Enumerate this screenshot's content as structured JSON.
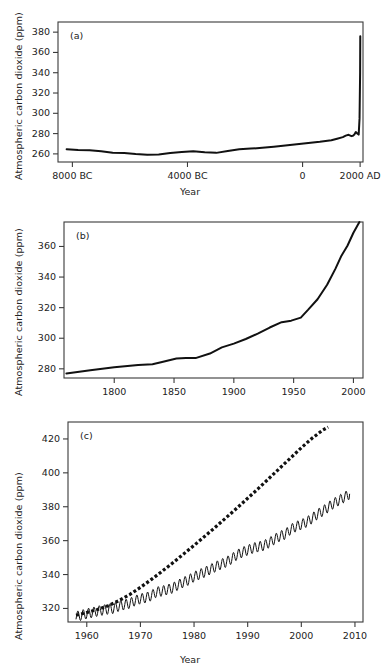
{
  "figure": {
    "ylabel": "Atmospheric carbon dioxide (ppm)",
    "xlabel": "Year"
  },
  "chart_data": [
    {
      "type": "line",
      "panel": "(a)",
      "title": "",
      "xlabel": "Year",
      "ylabel": "Atmospheric carbon dioxide (ppm)",
      "xlim": [
        -8500,
        2100
      ],
      "ylim": [
        252,
        390
      ],
      "xticks": [
        -8000,
        -4000,
        0,
        2000
      ],
      "xticklabels": [
        "8000 BC",
        "4000 BC",
        "0",
        "2000 AD"
      ],
      "yticks": [
        260,
        280,
        300,
        320,
        340,
        360,
        380
      ],
      "yticklabels": [
        "260",
        "280",
        "300",
        "320",
        "340",
        "360",
        "380"
      ],
      "grid": false,
      "legend": "none",
      "series": [
        {
          "name": "Ice-core and modern CO2",
          "style": "solid",
          "x": [
            -8200,
            -7800,
            -7400,
            -7000,
            -6600,
            -6200,
            -5800,
            -5400,
            -5000,
            -4600,
            -4200,
            -3800,
            -3400,
            -3000,
            -2600,
            -2200,
            -1800,
            -1400,
            -1000,
            -600,
            -200,
            200,
            600,
            1000,
            1200,
            1400,
            1500,
            1600,
            1700,
            1750,
            1800,
            1850,
            1900,
            1950,
            1980,
            2000,
            2005
          ],
          "y": [
            264.5,
            263.8,
            263.5,
            262.5,
            261.2,
            260.8,
            259.8,
            259.2,
            259.5,
            260.8,
            261.8,
            262.5,
            261.5,
            261.0,
            262.8,
            264.5,
            265.2,
            266.0,
            267.0,
            268.2,
            269.5,
            270.8,
            272.0,
            273.5,
            275.0,
            276.5,
            278.0,
            278.8,
            277.5,
            277.8,
            279.0,
            281.5,
            280.2,
            279.0,
            295.0,
            340.0,
            376.0
          ]
        }
      ]
    },
    {
      "type": "line",
      "panel": "(b)",
      "title": "",
      "xlabel": "",
      "ylabel": "Atmospheric carbon dioxide (ppm)",
      "xlim": [
        1758,
        2008
      ],
      "ylim": [
        274,
        376
      ],
      "xticks": [
        1800,
        1850,
        1900,
        1950,
        2000
      ],
      "xticklabels": [
        "1800",
        "1850",
        "1900",
        "1950",
        "2000"
      ],
      "yticks": [
        280,
        300,
        320,
        340,
        360
      ],
      "yticklabels": [
        "280",
        "300",
        "320",
        "340",
        "360"
      ],
      "grid": false,
      "legend": "none",
      "series": [
        {
          "name": "CO2 since 1760",
          "style": "solid",
          "x": [
            1760,
            1780,
            1800,
            1820,
            1832,
            1840,
            1852,
            1860,
            1868,
            1880,
            1890,
            1900,
            1910,
            1920,
            1930,
            1940,
            1948,
            1956,
            1962,
            1970,
            1978,
            1985,
            1990,
            1995,
            2000,
            2005
          ],
          "y": [
            277.0,
            279.0,
            281.0,
            282.5,
            283.0,
            284.5,
            286.8,
            287.0,
            287.0,
            290.0,
            294.0,
            296.5,
            299.5,
            303.0,
            307.0,
            310.5,
            311.5,
            313.5,
            318.5,
            325.5,
            335.0,
            345.5,
            354.0,
            360.5,
            369.0,
            376.0
          ]
        }
      ]
    },
    {
      "type": "line",
      "panel": "(c)",
      "title": "",
      "xlabel": "Year",
      "ylabel": "Atmospheric carbon dioxide (ppm)",
      "xlim": [
        1956.5,
        2011.5
      ],
      "ylim": [
        312,
        430
      ],
      "xticks": [
        1960,
        1970,
        1980,
        1990,
        2000,
        2010
      ],
      "xticklabels": [
        "1960",
        "1970",
        "1980",
        "1990",
        "2000",
        "2010"
      ],
      "yticks": [
        320,
        340,
        360,
        380,
        400,
        420
      ],
      "yticklabels": [
        "320",
        "340",
        "360",
        "380",
        "400",
        "420"
      ],
      "grid": false,
      "legend": "none",
      "series": [
        {
          "name": "Mauna Loa monthly CO2 (seasonal cycle)",
          "style": "solid-sawtooth",
          "seasonal_amplitude": 3.0,
          "x": [
            1958,
            1959,
            1960,
            1961,
            1962,
            1963,
            1964,
            1965,
            1966,
            1967,
            1968,
            1969,
            1970,
            1971,
            1972,
            1973,
            1974,
            1975,
            1976,
            1977,
            1978,
            1979,
            1980,
            1981,
            1982,
            1983,
            1984,
            1985,
            1986,
            1987,
            1988,
            1989,
            1990,
            1991,
            1992,
            1993,
            1994,
            1995,
            1996,
            1997,
            1998,
            1999,
            2000,
            2001,
            2002,
            2003,
            2004,
            2005,
            2006,
            2007,
            2008,
            2009
          ],
          "y": [
            315.3,
            316.0,
            316.9,
            317.6,
            318.4,
            319.0,
            319.6,
            320.0,
            321.4,
            322.2,
            323.0,
            324.6,
            325.7,
            326.3,
            327.5,
            329.7,
            330.2,
            331.1,
            332.0,
            333.8,
            335.4,
            336.8,
            338.7,
            340.1,
            341.4,
            343.0,
            344.6,
            346.0,
            347.4,
            349.2,
            351.6,
            353.1,
            354.4,
            355.6,
            356.4,
            357.1,
            358.8,
            360.8,
            362.6,
            363.8,
            366.6,
            368.3,
            369.5,
            371.0,
            373.1,
            375.6,
            377.4,
            379.7,
            381.9,
            383.7,
            385.6,
            387.4
          ]
        },
        {
          "name": "Upper projection",
          "style": "dotted",
          "x": [
            1958,
            1960,
            1962,
            1964,
            1966,
            1968,
            1970,
            1972,
            1974,
            1976,
            1978,
            1980,
            1982,
            1984,
            1986,
            1988,
            1990,
            1992,
            1994,
            1996,
            1998,
            2000,
            2002,
            2004,
            2005
          ],
          "y": [
            316.0,
            317.6,
            319.4,
            321.6,
            324.6,
            328.2,
            332.4,
            337.0,
            341.8,
            346.8,
            352.0,
            357.2,
            362.6,
            368.0,
            373.6,
            379.2,
            385.0,
            390.8,
            396.8,
            402.8,
            408.8,
            414.8,
            420.4,
            425.2,
            427.0
          ]
        }
      ]
    }
  ]
}
